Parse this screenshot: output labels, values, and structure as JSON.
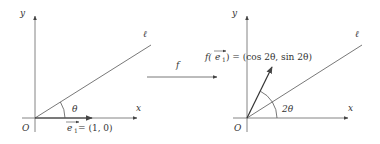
{
  "left_panel": {
    "y_label": "y",
    "x_label": "x",
    "origin_label": "O",
    "line_label": "ℓ",
    "angle_label": "θ",
    "vector_label_prefix": "e",
    "vector_label_sub": "1",
    "vector_value": " = (1, 0)"
  },
  "map_label": "f",
  "right_panel": {
    "y_label": "y",
    "x_label": "x",
    "origin_label": "O",
    "line_label": "ℓ",
    "angle_label": "2θ",
    "image_label_f": "f(",
    "image_label_e": "e",
    "image_label_sub": "1",
    "image_label_rest": ") = (cos 2θ, sin 2θ)"
  },
  "colors": {
    "stroke": "#555555",
    "text": "#333333"
  }
}
